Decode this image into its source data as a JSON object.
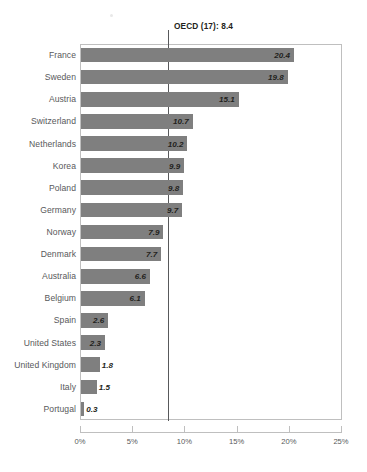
{
  "chart_data": {
    "type": "bar",
    "orientation": "horizontal",
    "title": "",
    "subtitle": "",
    "xlabel": "",
    "ylabel": "",
    "xlim": [
      0,
      25
    ],
    "grid": false,
    "legend": null,
    "categories": [
      "France",
      "Sweden",
      "Austria",
      "Switzerland",
      "Netherlands",
      "Korea",
      "Poland",
      "Germany",
      "Norway",
      "Denmark",
      "Australia",
      "Belgium",
      "Spain",
      "United States",
      "United Kingdom",
      "Italy",
      "Portugal"
    ],
    "values": [
      20.4,
      19.8,
      15.1,
      10.7,
      10.2,
      9.9,
      9.8,
      9.7,
      7.9,
      7.7,
      6.6,
      6.1,
      2.6,
      2.3,
      1.8,
      1.5,
      0.3
    ],
    "value_labels": [
      "20.4",
      "19.8",
      "15.1",
      "10.7",
      "10.2",
      "9.9",
      "9.8",
      "9.7",
      "7.9",
      "7.7",
      "6.6",
      "6.1",
      "2.6",
      "2.3",
      "1.8",
      "1.5",
      "0.3"
    ],
    "xticks": [
      0,
      5,
      10,
      15,
      20,
      25
    ],
    "xtick_labels": [
      "0%",
      "5%",
      "10%",
      "15%",
      "20%",
      "25%"
    ],
    "annotations": [
      {
        "name": "oecd-reference",
        "label": "OECD (17): 8.4",
        "value": 8.4,
        "type": "vertical-line"
      }
    ],
    "colors": {
      "bar": "#7f7f7f",
      "reference_line": "#58595b",
      "frame": "#bfbfbf",
      "label_text": "#58595b",
      "value_text": "#231f20",
      "background": "#ffffff"
    }
  }
}
